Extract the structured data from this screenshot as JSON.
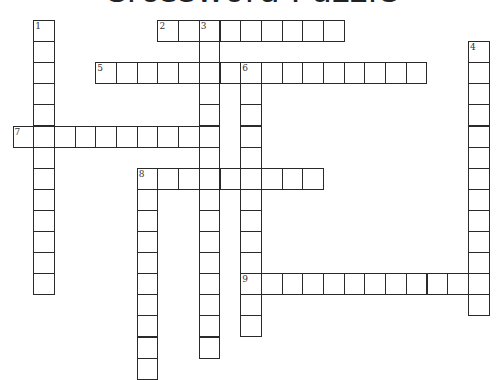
{
  "title": "Crossword Puzzle",
  "grid": {
    "origin_x": 12.5,
    "origin_y": 20,
    "pitch_x": 20.7,
    "pitch_y": 21.1
  },
  "entries": [
    {
      "number": "1",
      "direction": "down",
      "row": 0,
      "col": 1,
      "length": 13
    },
    {
      "number": "2",
      "direction": "across",
      "row": 0,
      "col": 7,
      "length": 9
    },
    {
      "number": "3",
      "direction": "down",
      "row": 0,
      "col": 9,
      "length": 16
    },
    {
      "number": "4",
      "direction": "down",
      "row": 1,
      "col": 22,
      "length": 13
    },
    {
      "number": "5",
      "direction": "across",
      "row": 2,
      "col": 4,
      "length": 16
    },
    {
      "number": "6",
      "direction": "down",
      "row": 2,
      "col": 11,
      "length": 13
    },
    {
      "number": "7",
      "direction": "across",
      "row": 5,
      "col": 0,
      "length": 10
    },
    {
      "number": "8",
      "direction": "across",
      "row": 7,
      "col": 6,
      "length": 9
    },
    {
      "number": "8d",
      "label": "",
      "direction": "down",
      "row": 7,
      "col": 6,
      "length": 10
    },
    {
      "number": "9",
      "direction": "across",
      "row": 12,
      "col": 11,
      "length": 12
    }
  ],
  "colors": {
    "grid_line": "#2a2a2a",
    "background": "#ffffff",
    "number": "#333333"
  }
}
